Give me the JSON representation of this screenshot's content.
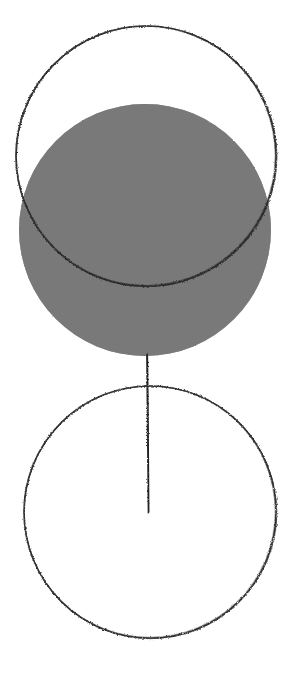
{
  "document": {
    "title": "Hand-drawn geometric figure",
    "medium": "pencil-on-paper scan",
    "background_color": "#ffffff",
    "width": 289,
    "height": 678
  },
  "palette": {
    "paper": "#ffffff",
    "ink": "#2b2b2b",
    "fill_gray": "#808080",
    "fill_gray_shadow": "#7a7a7a"
  },
  "figure": {
    "name": "two-circles-with-radius-line",
    "shapes": [
      {
        "id": "upper-outline-circle",
        "type": "circle",
        "style": "outline",
        "stroke_color": "#2b2b2b",
        "stroke_width": 1.6,
        "cx": 146,
        "cy": 156,
        "r": 130,
        "bounds": {
          "left": 16,
          "top": 26,
          "right": 276,
          "bottom": 286
        }
      },
      {
        "id": "filled-gray-circle",
        "type": "circle",
        "style": "filled",
        "fill_color": "#808080",
        "stroke_color": "none",
        "cx": 145,
        "cy": 230,
        "r": 126,
        "bounds": {
          "left": 19,
          "top": 104,
          "right": 271,
          "bottom": 356
        }
      },
      {
        "id": "lower-outline-circle",
        "type": "circle",
        "style": "outline",
        "stroke_color": "#2b2b2b",
        "stroke_width": 1.6,
        "cx": 150,
        "cy": 512,
        "r": 126,
        "bounds": {
          "left": 24,
          "top": 386,
          "right": 276,
          "bottom": 638
        }
      },
      {
        "id": "vertical-radius-line",
        "type": "line",
        "style": "stroke",
        "stroke_color": "#2b2b2b",
        "stroke_width": 1.6,
        "x1": 147,
        "y1": 354,
        "x2": 148,
        "y2": 513
      }
    ],
    "annotations": {
      "upper_label": "",
      "lower_label": "",
      "line_label": ""
    }
  }
}
